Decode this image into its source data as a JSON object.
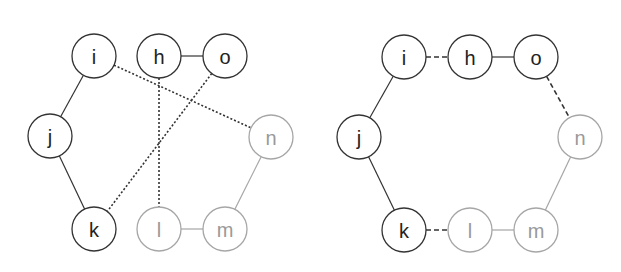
{
  "panels": [
    {
      "id": "left",
      "nodes": [
        {
          "label": "i",
          "x": 94,
          "y": 56,
          "tone": "dark"
        },
        {
          "label": "h",
          "x": 159,
          "y": 56,
          "tone": "dark"
        },
        {
          "label": "o",
          "x": 225,
          "y": 56,
          "tone": "dark"
        },
        {
          "label": "j",
          "x": 50,
          "y": 136,
          "tone": "dark"
        },
        {
          "label": "n",
          "x": 271,
          "y": 137,
          "tone": "light"
        },
        {
          "label": "k",
          "x": 94,
          "y": 229,
          "tone": "dark"
        },
        {
          "label": "l",
          "x": 159,
          "y": 229,
          "tone": "light"
        },
        {
          "label": "m",
          "x": 225,
          "y": 229,
          "tone": "light"
        }
      ],
      "edges": [
        {
          "from": "i",
          "to": "j",
          "style": "solid-dark"
        },
        {
          "from": "j",
          "to": "k",
          "style": "solid-dark"
        },
        {
          "from": "h",
          "to": "o",
          "style": "solid-dark"
        },
        {
          "from": "l",
          "to": "m",
          "style": "solid-light"
        },
        {
          "from": "m",
          "to": "n",
          "style": "solid-light"
        },
        {
          "from": "i",
          "to": "n",
          "style": "dotted"
        },
        {
          "from": "h",
          "to": "l",
          "style": "dotted"
        },
        {
          "from": "o",
          "to": "k",
          "style": "dotted"
        }
      ]
    },
    {
      "id": "right",
      "nodes": [
        {
          "label": "i",
          "x": 404,
          "y": 57,
          "tone": "dark"
        },
        {
          "label": "h",
          "x": 470,
          "y": 57,
          "tone": "dark"
        },
        {
          "label": "o",
          "x": 536,
          "y": 57,
          "tone": "dark"
        },
        {
          "label": "j",
          "x": 359,
          "y": 137,
          "tone": "dark"
        },
        {
          "label": "n",
          "x": 580,
          "y": 137,
          "tone": "light"
        },
        {
          "label": "k",
          "x": 404,
          "y": 230,
          "tone": "dark"
        },
        {
          "label": "l",
          "x": 470,
          "y": 230,
          "tone": "light"
        },
        {
          "label": "m",
          "x": 536,
          "y": 230,
          "tone": "light"
        }
      ],
      "edges": [
        {
          "from": "i",
          "to": "j",
          "style": "solid-dark"
        },
        {
          "from": "j",
          "to": "k",
          "style": "solid-dark"
        },
        {
          "from": "h",
          "to": "o",
          "style": "solid-dark"
        },
        {
          "from": "l",
          "to": "m",
          "style": "solid-light"
        },
        {
          "from": "m",
          "to": "n",
          "style": "solid-light"
        },
        {
          "from": "i",
          "to": "h",
          "style": "dashed"
        },
        {
          "from": "o",
          "to": "n",
          "style": "dashed"
        },
        {
          "from": "k",
          "to": "l",
          "style": "dashed"
        }
      ]
    }
  ],
  "node_radius": 22,
  "colors": {
    "dark": "#333333",
    "light": "#a6a6a6"
  }
}
